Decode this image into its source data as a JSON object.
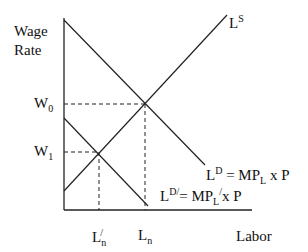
{
  "diagram": {
    "y_axis_label_line1": "Wage",
    "y_axis_label_line2": "Rate",
    "x_axis_label": "Labor",
    "supply_label": {
      "base": "L",
      "sup": "S"
    },
    "demand_label": {
      "base": "L",
      "sup": "D",
      "eq": " = MP",
      "sub": "L",
      "tail": " x P"
    },
    "demand2_label": {
      "base": "L",
      "sup": "D/",
      "eq": "= MP",
      "sub": "L",
      "prime": "/",
      "tail": "x P"
    },
    "w0_label": {
      "base": "W",
      "sub": "0"
    },
    "w1_label": {
      "base": "W",
      "sub": "1"
    },
    "ln_prime_label": {
      "base": "L",
      "sub": "n",
      "sup": "/"
    },
    "ln_label": {
      "base": "L",
      "sub": "n"
    },
    "colors": {
      "line": "#222222",
      "background": "#ffffff"
    }
  }
}
